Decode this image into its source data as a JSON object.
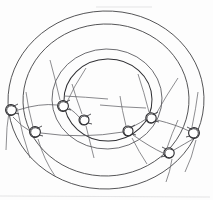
{
  "figure": {
    "caption": "",
    "background_color": "#fdfdfd",
    "ink_color": "#2f2f33",
    "style": "hand-drawn line drawing"
  },
  "chart_data": {
    "type": "diagram",
    "center": {
      "x": 106,
      "y": 99
    },
    "rings": [
      {
        "name": "outer-ring",
        "radius_x": 98,
        "radius_y": 89,
        "label": ""
      },
      {
        "name": "second-ring",
        "radius_x": 83,
        "radius_y": 76,
        "label": ""
      },
      {
        "name": "third-ring",
        "radius_x": 55,
        "radius_y": 50,
        "label": ""
      },
      {
        "name": "inner-disc",
        "radius_x": 44,
        "radius_y": 41,
        "label": ""
      }
    ],
    "radius_line": {
      "from": {
        "x": 106,
        "y": 99
      },
      "to": {
        "x": 63,
        "y": 96
      },
      "label": ""
    },
    "nodes": [
      {
        "id": "node-1",
        "x": 11,
        "y": 110,
        "ring": "outer-ring",
        "label": ""
      },
      {
        "id": "node-2",
        "x": 63,
        "y": 106,
        "ring": "second-ring",
        "label": ""
      },
      {
        "id": "node-3",
        "x": 84,
        "y": 120,
        "ring": "third-ring",
        "label": ""
      },
      {
        "id": "node-4",
        "x": 35,
        "y": 132,
        "ring": "second-ring",
        "label": ""
      },
      {
        "id": "node-5",
        "x": 128,
        "y": 131,
        "ring": "third-ring",
        "label": ""
      },
      {
        "id": "node-6",
        "x": 151,
        "y": 118,
        "ring": "second-ring",
        "label": ""
      },
      {
        "id": "node-7",
        "x": 169,
        "y": 153,
        "ring": "second-ring",
        "label": ""
      },
      {
        "id": "node-8",
        "x": 194,
        "y": 133,
        "ring": "outer-ring",
        "label": ""
      }
    ],
    "connections": [
      {
        "from": "node-1",
        "to": "node-2"
      },
      {
        "from": "node-2",
        "to": "node-3"
      },
      {
        "from": "node-1",
        "to": "node-4"
      },
      {
        "from": "node-4",
        "to": "node-5"
      },
      {
        "from": "node-5",
        "to": "node-6"
      },
      {
        "from": "node-6",
        "to": "node-8"
      },
      {
        "from": "node-5",
        "to": "node-7"
      },
      {
        "from": "node-7",
        "to": "node-8"
      }
    ],
    "annotations": [],
    "legend": [],
    "xlabel": "",
    "ylabel": ""
  }
}
